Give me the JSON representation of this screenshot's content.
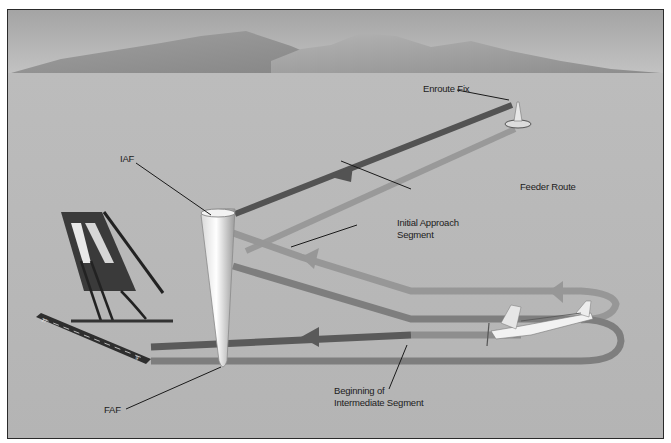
{
  "figure": {
    "type": "instrument-approach-segments-diagram",
    "labels": {
      "enroute_fix": "Enroute Fix",
      "feeder_route": "Feeder Route",
      "iaf": "IAF",
      "initial_approach_line1": "Initial Approach",
      "initial_approach_line2": "Segment",
      "faf": "FAF",
      "intermediate_line1": "Beginning of",
      "intermediate_line2": "Intermediate Segment"
    },
    "runway_numbers": [
      "27",
      "9"
    ],
    "colors": {
      "background": "#b9b9b9",
      "sky_top": "#a8a8a8",
      "mountain": "#8e8e8e",
      "feeder_route_dark": "#555555",
      "initial_route": "#8f8f8f",
      "intermediate_route": "#7a7a7a",
      "final_route_dark": "#595959",
      "frame": "#2a2a2a"
    }
  }
}
